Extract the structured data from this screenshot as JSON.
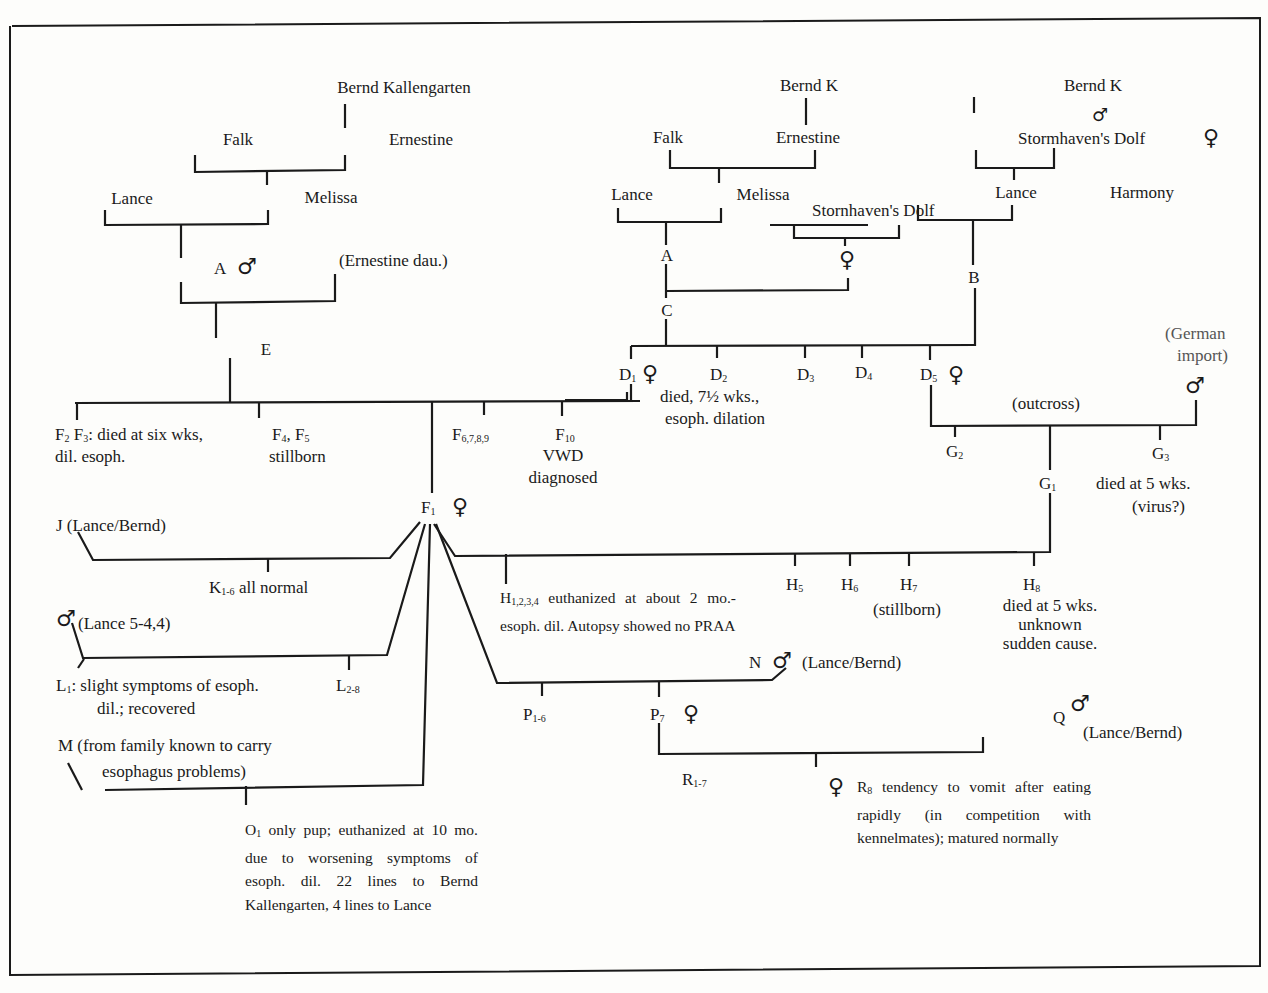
{
  "symbols": {
    "male": "♂",
    "female": "♀"
  },
  "pedigree_left": {
    "bernd": "Bernd Kallengarten",
    "falk": "Falk",
    "ernestine": "Ernestine",
    "lance": "Lance",
    "melissa": "Melissa",
    "a": "A",
    "ernestine_dau": "(Ernestine dau.)",
    "e": "E"
  },
  "pedigree_middle": {
    "bernd": "Bernd K",
    "falk": "Falk",
    "ernestine": "Ernestine",
    "lance": "Lance",
    "melissa": "Melissa",
    "stormhaven": "Stornhaven's Dolf",
    "a": "A",
    "c": "C"
  },
  "pedigree_right": {
    "bernd": "Bernd K",
    "stormhaven": "Stormhaven's Dolf",
    "lance": "Lance",
    "harmony": "Harmony",
    "b": "B",
    "german_import_1": "(German",
    "german_import_2": "import)"
  },
  "d_litter": {
    "d1": "D",
    "d1_sub": "1",
    "d2": "D",
    "d2_sub": "2",
    "d2_note_1": "died, 7½ wks.,",
    "d2_note_2": "esoph. dilation",
    "d3": "D",
    "d3_sub": "3",
    "d4": "D",
    "d4_sub": "4",
    "d5": "D",
    "d5_sub": "5",
    "outcross": "(outcross)"
  },
  "f_litter": {
    "f2f3_a": "F",
    "f2_sub": "2",
    "f3_b": " F",
    "f3_sub": "3",
    "f2f3_note_1": ": died at six wks,",
    "f2f3_note_2": "dil. esoph.",
    "f4": "F",
    "f4_sub": "4",
    "f5": ",  F",
    "f5_sub": "5",
    "f45_note": "stillborn",
    "f6": "F",
    "f6_sub": "6,7,8,9",
    "f10": "F",
    "f10_sub": "10",
    "f10_note_1": "VWD",
    "f10_note_2": "diagnosed",
    "f1": "F",
    "f1_sub": "1"
  },
  "g_litter": {
    "g1": "G",
    "g1_sub": "1",
    "g2": "G",
    "g2_sub": "2",
    "g3": "G",
    "g3_sub": "3",
    "g3_note_1": "died at 5 wks.",
    "g3_note_2": "(virus?)"
  },
  "matings": {
    "j": "J (Lance/Bernd)",
    "k": "K",
    "k_sub": "1-6",
    "k_note": " all normal",
    "l_sire": "(Lance 5-4,4)",
    "l1": "L",
    "l1_sub": "1",
    "l1_note_1": ":  slight symptoms of esoph.",
    "l1_note_2": "dil.; recovered",
    "l28": "L",
    "l28_sub": "2-8",
    "m_1": "M (from family known to carry",
    "m_2": "esophagus problems)",
    "o1": "O",
    "o1_sub": "1",
    "o1_note": " only pup; euthanized at 10 mo. due to worsening symptoms of esoph. dil. 22 lines to Bernd Kallengarten, 4 lines to Lance",
    "h14": "H",
    "h14_sub": "1,2,3,4",
    "h14_note": " euthanized at about 2 mo.- esoph. dil. Autopsy showed no PRAA",
    "h5": "H",
    "h5_sub": "5",
    "h6": "H",
    "h6_sub": "6",
    "h7": "H",
    "h7_sub": "7",
    "h7_note": "(stillborn)",
    "h8": "H",
    "h8_sub": "8",
    "h8_note_1": "died at 5 wks.",
    "h8_note_2": "unknown",
    "h8_note_3": "sudden cause.",
    "n": "N",
    "n_note": "(Lance/Bernd)",
    "p16": "P",
    "p16_sub": "1-6",
    "p7": "P",
    "p7_sub": "7",
    "q": "Q",
    "q_note": "(Lance/Bernd)",
    "r17": "R",
    "r17_sub": "1-7",
    "r8": "R",
    "r8_sub": "8",
    "r8_note": " tendency to vomit after eating rapidly (in competition with kennelmates); matured normally"
  }
}
